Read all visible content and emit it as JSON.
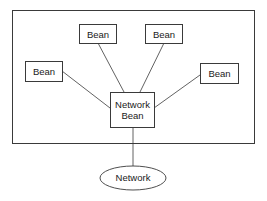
{
  "diagram": {
    "container": {
      "label": ""
    },
    "beans": [
      {
        "id": "bean-top-left",
        "label": "Bean"
      },
      {
        "id": "bean-top-right",
        "label": "Bean"
      },
      {
        "id": "bean-left",
        "label": "Bean"
      },
      {
        "id": "bean-right",
        "label": "Bean"
      }
    ],
    "hub": {
      "line1": "Network",
      "line2": "Bean"
    },
    "network": {
      "label": "Network"
    },
    "colors": {
      "stroke": "#3a3a3a",
      "background": "#ffffff",
      "text": "#1a1a1a"
    }
  }
}
